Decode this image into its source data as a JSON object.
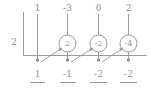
{
  "diagram": {
    "type": "synthetic-division",
    "divisor": "2",
    "top_row_label": "dividend-coefficients",
    "coefficients": [
      "1",
      "-3",
      "0",
      "2"
    ],
    "circled_values": [
      "2",
      "-2",
      "-4"
    ],
    "results": [
      "1",
      "-1",
      "-2",
      "-2"
    ],
    "colors": {
      "background": "#ffffff",
      "ink": "#8f8f8f",
      "rule": "#9a9a9a"
    },
    "columns_x": [
      37,
      67,
      98,
      128
    ],
    "circle_columns_x": [
      67,
      98,
      128
    ]
  }
}
